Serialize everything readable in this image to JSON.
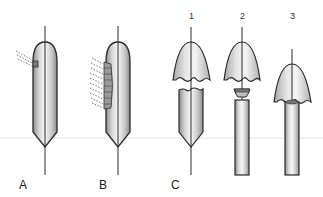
{
  "diagram": {
    "panels": [
      {
        "id": "A",
        "label": "A",
        "description": "balloon with small localized focus"
      },
      {
        "id": "B",
        "label": "B",
        "description": "balloon with elongated lateral focus"
      },
      {
        "id": "C",
        "label": "C",
        "description": "separation sequence",
        "steps": [
          "1",
          "2",
          "3"
        ]
      }
    ]
  },
  "colors": {
    "outline": "#2a2a2a",
    "fill_light": "#f2f2f2",
    "fill_dark": "#9a9a9a",
    "guide_line": "#e2e2e2"
  }
}
